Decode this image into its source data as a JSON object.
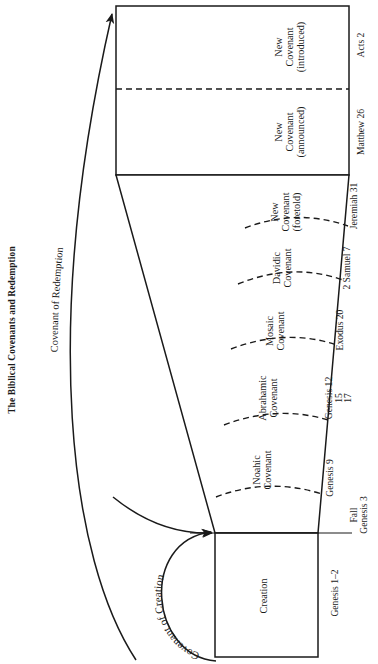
{
  "figure": {
    "title": "The Biblical Covenants and Redemption",
    "overarching_label": "Covenant of Redemption",
    "creation_arc_label": "Covenant of Creation",
    "event_marker": {
      "line1": "Fall",
      "line2": "Genesis 3"
    }
  },
  "segments": [
    {
      "id": "creation",
      "name_line1": "Creation",
      "name_line2": "",
      "name_line3": "",
      "reference": "Genesis 1–2",
      "reference_extra": []
    },
    {
      "id": "noahic",
      "name_line1": "Noahic",
      "name_line2": "Covenant",
      "name_line3": "",
      "reference": "Genesis 9",
      "reference_extra": []
    },
    {
      "id": "abrahamic",
      "name_line1": "Abrahamic",
      "name_line2": "Covenant",
      "name_line3": "",
      "reference": "Genesis 12",
      "reference_extra": [
        "15",
        "17"
      ]
    },
    {
      "id": "mosaic",
      "name_line1": "Mosaic",
      "name_line2": "Covenant",
      "name_line3": "",
      "reference": "Exodus 20",
      "reference_extra": []
    },
    {
      "id": "davidic",
      "name_line1": "Davidic",
      "name_line2": "Covenant",
      "name_line3": "",
      "reference": "2 Samuel 7",
      "reference_extra": []
    },
    {
      "id": "new-foretold",
      "name_line1": "New",
      "name_line2": "Covenant",
      "name_line3": "(foretold)",
      "reference": "Jeremiah 31",
      "reference_extra": []
    },
    {
      "id": "new-announced",
      "name_line1": "New",
      "name_line2": "Covenant",
      "name_line3": "(announced)",
      "reference": "Matthew 26",
      "reference_extra": []
    },
    {
      "id": "new-introduced",
      "name_line1": "New",
      "name_line2": "Covenant",
      "name_line3": "(introduced)",
      "reference": "Acts 2",
      "reference_extra": []
    }
  ],
  "colors": {
    "stroke": "#1a1a1a",
    "background": "#ffffff",
    "text": "#1a1a1a"
  }
}
